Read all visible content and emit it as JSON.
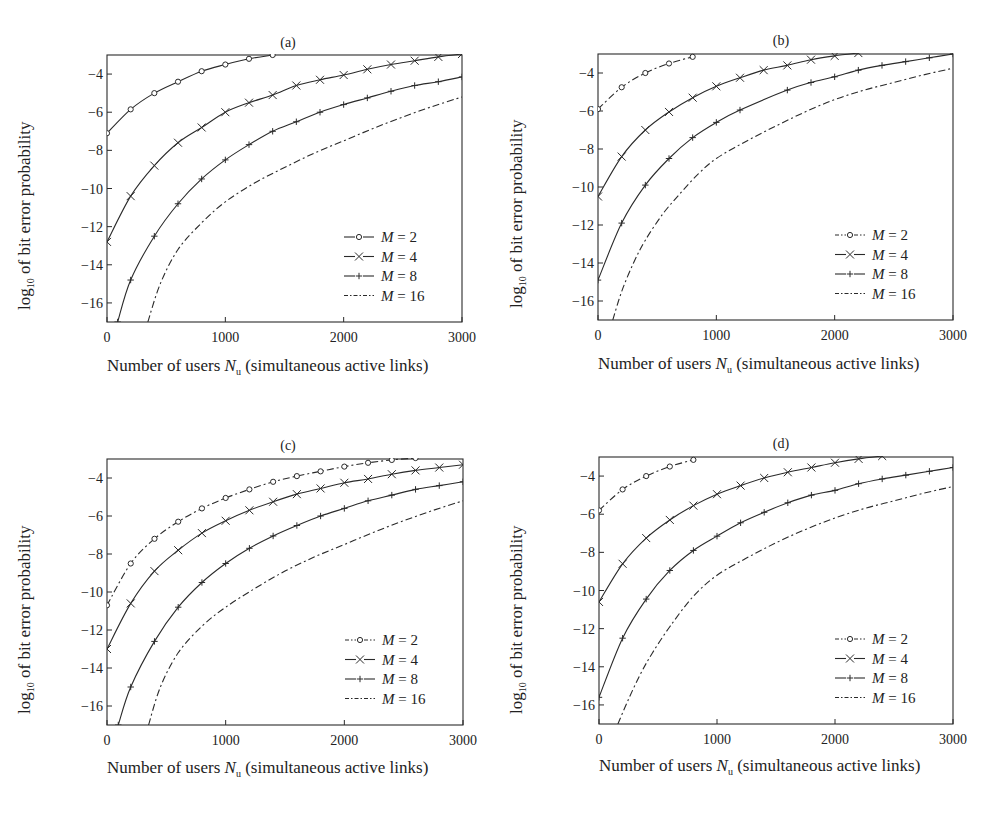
{
  "figure": {
    "y_axis_label_prefix": "log",
    "y_axis_label_sub": "10",
    "y_axis_label_suffix": " of bit error probability",
    "x_axis_label_prefix": "Number of users ",
    "x_axis_label_var": "N",
    "x_axis_label_sub": "u",
    "x_axis_label_suffix": " (simultaneous active links)"
  },
  "chart_data": [
    {
      "type": "line",
      "title": "(a)",
      "xlabel": "Number of users N_u (simultaneous active links)",
      "ylabel": "log10 of bit error probability",
      "xlim": [
        0,
        3000
      ],
      "ylim": [
        -17,
        -3
      ],
      "xticks": [
        0,
        1000,
        2000,
        3000
      ],
      "yticks": [
        -4,
        -6,
        -8,
        -10,
        -12,
        -14,
        -16
      ],
      "grid": false,
      "legend_position": "lower right",
      "series": [
        {
          "name": "M = 2",
          "label_var": "M",
          "label_val": "= 2",
          "linestyle": "solid",
          "marker": "circle",
          "x": [
            0,
            200,
            400,
            600,
            800,
            1000,
            1200,
            1400
          ],
          "y": [
            -7.1,
            -5.85,
            -5.0,
            -4.4,
            -3.85,
            -3.5,
            -3.2,
            -3.0
          ]
        },
        {
          "name": "M = 4",
          "label_var": "M",
          "label_val": "= 4",
          "linestyle": "solid",
          "marker": "x",
          "x": [
            0,
            200,
            400,
            600,
            800,
            1000,
            1200,
            1400,
            1600,
            1800,
            2000,
            2200,
            2400,
            2600,
            2800,
            3000
          ],
          "y": [
            -12.8,
            -10.4,
            -8.8,
            -7.6,
            -6.8,
            -6.0,
            -5.5,
            -5.1,
            -4.6,
            -4.3,
            -4.05,
            -3.75,
            -3.5,
            -3.3,
            -3.1,
            -2.95
          ]
        },
        {
          "name": "M = 8",
          "label_var": "M",
          "label_val": "= 8",
          "linestyle": "solid",
          "marker": "plus",
          "x": [
            90,
            200,
            400,
            600,
            800,
            1000,
            1200,
            1400,
            1600,
            1800,
            2000,
            2200,
            2400,
            2600,
            2800,
            3000
          ],
          "y": [
            -17.0,
            -14.8,
            -12.5,
            -10.8,
            -9.5,
            -8.5,
            -7.7,
            -7.0,
            -6.5,
            -6.0,
            -5.6,
            -5.25,
            -4.9,
            -4.6,
            -4.4,
            -4.15
          ]
        },
        {
          "name": "M = 16",
          "label_var": "M",
          "label_val": "= 16",
          "linestyle": "dashdot",
          "marker": "none",
          "x": [
            345,
            450,
            600,
            800,
            1000,
            1250,
            1500,
            1750,
            2000,
            2250,
            2500,
            2750,
            3000
          ],
          "y": [
            -17.0,
            -15.0,
            -13.2,
            -11.8,
            -10.7,
            -9.7,
            -8.9,
            -8.15,
            -7.5,
            -6.85,
            -6.25,
            -5.7,
            -5.2
          ]
        }
      ]
    },
    {
      "type": "line",
      "title": "(b)",
      "xlabel": "Number of users N_u (simultaneous active links)",
      "ylabel": "log10 of bit error probability",
      "xlim": [
        0,
        3000
      ],
      "ylim": [
        -17,
        -3
      ],
      "xticks": [
        0,
        1000,
        2000,
        3000
      ],
      "yticks": [
        -4,
        -6,
        -8,
        -10,
        -12,
        -14,
        -16
      ],
      "grid": false,
      "legend_position": "lower right",
      "series": [
        {
          "name": "M = 2",
          "label_var": "M",
          "label_val": "= 2",
          "linestyle": "dashdot",
          "marker": "circle",
          "x": [
            0,
            200,
            400,
            600,
            800
          ],
          "y": [
            -5.9,
            -4.75,
            -4.0,
            -3.5,
            -3.15
          ]
        },
        {
          "name": "M = 4",
          "label_var": "M",
          "label_val": "= 4",
          "linestyle": "solid",
          "marker": "x",
          "x": [
            0,
            200,
            400,
            600,
            800,
            1000,
            1200,
            1400,
            1600,
            1800,
            2000,
            2200
          ],
          "y": [
            -10.5,
            -8.4,
            -7.0,
            -6.05,
            -5.3,
            -4.7,
            -4.25,
            -3.85,
            -3.6,
            -3.3,
            -3.1,
            -2.95
          ]
        },
        {
          "name": "M = 8",
          "label_var": "M",
          "label_val": "= 8",
          "linestyle": "solid",
          "marker": "plus",
          "x": [
            0,
            200,
            400,
            600,
            800,
            1000,
            1200,
            1600,
            1800,
            2000,
            2200,
            2400,
            2600,
            2800,
            3000
          ],
          "y": [
            -14.9,
            -11.9,
            -9.9,
            -8.5,
            -7.4,
            -6.6,
            -5.95,
            -4.9,
            -4.5,
            -4.2,
            -3.85,
            -3.6,
            -3.4,
            -3.2,
            -3.0
          ]
        },
        {
          "name": "M = 16",
          "label_var": "M",
          "label_val": "= 16",
          "linestyle": "dashdot",
          "marker": "none",
          "x": [
            125,
            200,
            300,
            400,
            550,
            700,
            850,
            1000,
            1250,
            1500,
            1750,
            2000,
            2250,
            2500,
            2750,
            3000
          ],
          "y": [
            -17.0,
            -15.5,
            -14.0,
            -12.8,
            -11.4,
            -10.3,
            -9.3,
            -8.5,
            -7.6,
            -6.8,
            -6.05,
            -5.4,
            -4.9,
            -4.5,
            -4.1,
            -3.75
          ]
        }
      ]
    },
    {
      "type": "line",
      "title": "(c)",
      "xlabel": "Number of users N_u (simultaneous active links)",
      "ylabel": "log10 of bit error probability",
      "xlim": [
        0,
        3000
      ],
      "ylim": [
        -17,
        -3
      ],
      "xticks": [
        0,
        1000,
        2000,
        3000
      ],
      "yticks": [
        -4,
        -6,
        -8,
        -10,
        -12,
        -14,
        -16
      ],
      "grid": false,
      "legend_position": "lower right",
      "series": [
        {
          "name": "M = 2",
          "label_var": "M",
          "label_val": "= 2",
          "linestyle": "dashdot",
          "marker": "circle",
          "x": [
            0,
            200,
            400,
            600,
            800,
            1000,
            1200,
            1400,
            1600,
            1800,
            2000,
            2200,
            2400,
            2600
          ],
          "y": [
            -10.7,
            -8.5,
            -7.2,
            -6.3,
            -5.6,
            -5.05,
            -4.6,
            -4.2,
            -3.9,
            -3.65,
            -3.4,
            -3.2,
            -3.05,
            -2.95
          ]
        },
        {
          "name": "M = 4",
          "label_var": "M",
          "label_val": "= 4",
          "linestyle": "solid",
          "marker": "x",
          "x": [
            0,
            200,
            400,
            600,
            800,
            1000,
            1200,
            1400,
            1600,
            1800,
            2000,
            2200,
            2400,
            2600,
            2800,
            3000
          ],
          "y": [
            -13.0,
            -10.6,
            -8.9,
            -7.8,
            -6.9,
            -6.25,
            -5.7,
            -5.25,
            -4.85,
            -4.55,
            -4.25,
            -4.05,
            -3.8,
            -3.6,
            -3.45,
            -3.3
          ]
        },
        {
          "name": "M = 8",
          "label_var": "M",
          "label_val": "= 8",
          "linestyle": "solid",
          "marker": "plus",
          "x": [
            95,
            200,
            400,
            600,
            800,
            1000,
            1200,
            1400,
            1600,
            1800,
            2000,
            2200,
            2400,
            2600,
            2800,
            3000
          ],
          "y": [
            -17.0,
            -15.0,
            -12.6,
            -10.8,
            -9.5,
            -8.5,
            -7.7,
            -7.05,
            -6.5,
            -6.0,
            -5.6,
            -5.2,
            -4.9,
            -4.6,
            -4.4,
            -4.2
          ]
        },
        {
          "name": "M = 16",
          "label_var": "M",
          "label_val": "= 16",
          "linestyle": "dashdot",
          "marker": "none",
          "x": [
            350,
            450,
            600,
            800,
            1000,
            1250,
            1500,
            1750,
            2000,
            2250,
            2500,
            2750,
            3000
          ],
          "y": [
            -17.0,
            -15.0,
            -13.2,
            -11.8,
            -10.8,
            -9.8,
            -8.9,
            -8.15,
            -7.5,
            -6.85,
            -6.25,
            -5.7,
            -5.2
          ]
        }
      ]
    },
    {
      "type": "line",
      "title": "(d)",
      "xlabel": "Number of users N_u (simultaneous active links)",
      "ylabel": "log10 of bit error probability",
      "xlim": [
        0,
        3000
      ],
      "ylim": [
        -17,
        -3
      ],
      "xticks": [
        0,
        1000,
        2000,
        3000
      ],
      "yticks": [
        -4,
        -6,
        -8,
        -10,
        -12,
        -14,
        -16
      ],
      "grid": false,
      "legend_position": "lower right",
      "series": [
        {
          "name": "M = 2",
          "label_var": "M",
          "label_val": "= 2",
          "linestyle": "dashdot",
          "marker": "circle",
          "x": [
            0,
            200,
            400,
            600,
            800
          ],
          "y": [
            -5.8,
            -4.7,
            -4.0,
            -3.5,
            -3.15
          ]
        },
        {
          "name": "M = 4",
          "label_var": "M",
          "label_val": "= 4",
          "linestyle": "solid",
          "marker": "x",
          "x": [
            0,
            200,
            400,
            600,
            800,
            1000,
            1200,
            1400,
            1600,
            1800,
            2000,
            2200,
            2400
          ],
          "y": [
            -10.6,
            -8.6,
            -7.25,
            -6.3,
            -5.55,
            -4.95,
            -4.5,
            -4.1,
            -3.8,
            -3.55,
            -3.3,
            -3.1,
            -2.95
          ]
        },
        {
          "name": "M = 8",
          "label_var": "M",
          "label_val": "= 8",
          "linestyle": "solid",
          "marker": "plus",
          "x": [
            0,
            200,
            400,
            600,
            800,
            1000,
            1200,
            1400,
            1600,
            1800,
            2000,
            2200,
            2400,
            2600,
            2800,
            3000
          ],
          "y": [
            -15.6,
            -12.5,
            -10.45,
            -8.95,
            -7.9,
            -7.15,
            -6.45,
            -5.9,
            -5.4,
            -5.0,
            -4.75,
            -4.4,
            -4.15,
            -3.95,
            -3.75,
            -3.55
          ]
        },
        {
          "name": "M = 16",
          "label_var": "M",
          "label_val": "= 16",
          "linestyle": "dashdot",
          "marker": "none",
          "x": [
            160,
            250,
            350,
            450,
            600,
            800,
            1000,
            1250,
            1500,
            1750,
            2000,
            2250,
            2500,
            2750,
            3000
          ],
          "y": [
            -17.0,
            -15.7,
            -14.4,
            -13.3,
            -11.9,
            -10.3,
            -9.2,
            -8.3,
            -7.5,
            -6.8,
            -6.2,
            -5.7,
            -5.3,
            -4.9,
            -4.55
          ]
        }
      ]
    }
  ]
}
